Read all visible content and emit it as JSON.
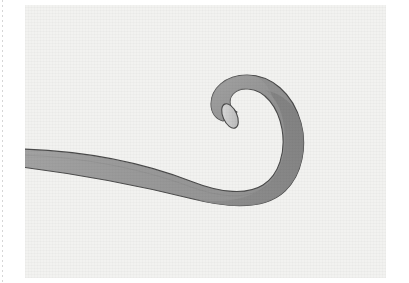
{
  "image": {
    "kind": "vector-illustration",
    "subject_label": "Curled ribbon",
    "alt_text": "A flat gray ribbon entering from the left edge, sweeping right and curving upward into a clockwise spiral curl whose cut end is shown as a light ellipse."
  },
  "canvas": {
    "background_color": "#f2f2f0",
    "left": 25,
    "top": 5,
    "width": 361,
    "height": 273,
    "texture": "paper-grain"
  },
  "margin": {
    "rule_name": "dotted-guide",
    "color": "#cfcfcf",
    "x": 2,
    "dash_on": 2,
    "dash_off": 3
  },
  "ribbon": {
    "label": "curled-ribbon",
    "outline_color": "#4a4a4a",
    "outline_width": 1.1,
    "fill_light": "#b4b4b4",
    "fill_mid": "#9b9b9b",
    "fill_dark": "#8a8a8a",
    "fill_darkest": "#7e7e7e",
    "endcap_fill": "#c9c9c9",
    "endcap_highlight": "#dcdcdc",
    "inner_hole_fill": "#f2f2f0"
  },
  "geometry": {
    "tail_entry_y_top": 167,
    "tail_entry_y_bottom": 185,
    "curl_center_x": 273,
    "curl_center_y": 113,
    "curl_outer_radius": 62,
    "curl_inner_radius": 33,
    "endcap_center_x": 240,
    "endcap_center_y": 112,
    "endcap_rx": 7,
    "endcap_ry": 13,
    "endcap_rotation_deg": -22
  }
}
